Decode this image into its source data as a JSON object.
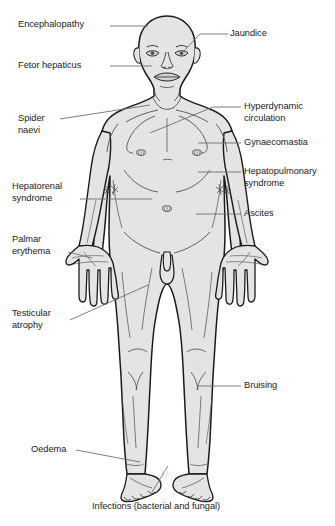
{
  "diagram": {
    "colors": {
      "skin_fill": "#e4e4e4",
      "outline": "#1a1a1a",
      "detail_line": "#4a4a4a",
      "leader_line": "#6f6f6f",
      "text": "#1b1b1b",
      "background": "#ffffff"
    },
    "labels_left": [
      {
        "id": "encephalopathy",
        "text": "Encephalopathy",
        "x": 18,
        "y": 19,
        "leader": {
          "x1": 110,
          "y1": 26,
          "x2": 148,
          "y2": 26
        },
        "target": "head / brain"
      },
      {
        "id": "fetor-hepaticus",
        "text": "Fetor hepaticus",
        "x": 18,
        "y": 60,
        "leader": {
          "x1": 110,
          "y1": 66,
          "x2": 152,
          "y2": 66
        },
        "target": "mouth"
      },
      {
        "id": "spider-naevi",
        "text": "Spider\nnaevi",
        "x": 18,
        "y": 113,
        "leader": {
          "x1": 60,
          "y1": 119,
          "x2": 150,
          "y2": 105
        },
        "target": "upper chest"
      },
      {
        "id": "hepatorenal-syndrome",
        "text": "Hepatorenal\nsyndrome",
        "x": 12,
        "y": 181,
        "leader": {
          "x1": 80,
          "y1": 199,
          "x2": 152,
          "y2": 199
        },
        "target": "kidneys / flank"
      },
      {
        "id": "palmar-erythema",
        "text": "Palmar\nerythema",
        "x": 12,
        "y": 234,
        "leader": {
          "x1": 68,
          "y1": 252,
          "x2": 92,
          "y2": 258
        },
        "target": "palm of left hand"
      },
      {
        "id": "testicular-atrophy",
        "text": "Testicular\natrophy",
        "x": 12,
        "y": 308,
        "leader": {
          "x1": 70,
          "y1": 320,
          "x2": 148,
          "y2": 285
        },
        "target": "testes"
      },
      {
        "id": "oedema",
        "text": "Oedema",
        "x": 31,
        "y": 444,
        "leader": {
          "x1": 76,
          "y1": 450,
          "x2": 140,
          "y2": 462
        },
        "target": "ankle / lower leg"
      }
    ],
    "labels_right": [
      {
        "id": "jaundice",
        "text": "Jaundice",
        "x": 230,
        "y": 28,
        "leader": {
          "x1": 195,
          "y1": 34,
          "x2": 172,
          "y2": 50
        },
        "target": "sclera of eye / skin"
      },
      {
        "id": "hyperdynamic-circulation",
        "text": "Hyperdynamic\ncirculation",
        "x": 244,
        "y": 101,
        "leader": {
          "x1": 203,
          "y1": 107,
          "x2": 180,
          "y2": 113
        },
        "target": "heart / circulation"
      },
      {
        "id": "gynaecomastia",
        "text": "Gynaecomastia",
        "x": 244,
        "y": 137,
        "leader": {
          "x1": 203,
          "y1": 143,
          "x2": 170,
          "y2": 143
        },
        "target": "breast tissue"
      },
      {
        "id": "hepatopulmonary-syndrome",
        "text": "Hepatopulmonary\nsyndrome",
        "x": 244,
        "y": 166,
        "leader": {
          "x1": 207,
          "y1": 172,
          "x2": 172,
          "y2": 172
        },
        "target": "lungs"
      },
      {
        "id": "ascites",
        "text": "Ascites",
        "x": 244,
        "y": 208,
        "leader": {
          "x1": 203,
          "y1": 214,
          "x2": 165,
          "y2": 214
        },
        "target": "abdomen"
      },
      {
        "id": "bruising",
        "text": "Bruising",
        "x": 244,
        "y": 380,
        "leader": {
          "x1": 203,
          "y1": 386,
          "x2": 165,
          "y2": 380
        },
        "target": "lower leg skin"
      }
    ],
    "labels_bottom": [
      {
        "id": "infections",
        "text": "Infections (bacterial and fungal)",
        "x": 92,
        "y": 501,
        "target": "feet / toes"
      }
    ]
  }
}
